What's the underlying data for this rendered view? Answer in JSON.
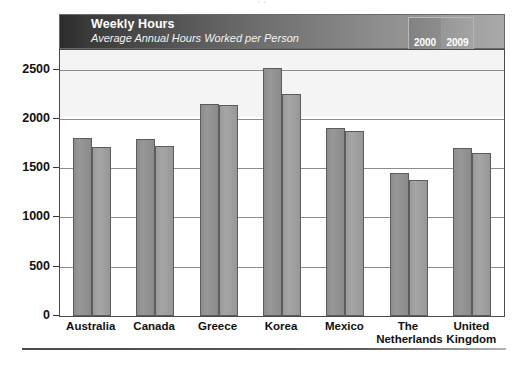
{
  "figure": {
    "clipped_top_text": "· ·",
    "bottom_rule": "divider"
  },
  "banner": {
    "title": "Weekly Hours",
    "subtitle": "Average Annual Hours Worked per Person"
  },
  "colors": {
    "series_2000": "#8f8f8f",
    "series_2009": "#9f9f9f",
    "banner_dark": "#2b2b2b",
    "banner_light": "#a9a9a9",
    "frame": "#4a4a4a",
    "gridline": "#8c8c8c",
    "band": "#f4f4f5"
  },
  "chart_data": {
    "type": "bar",
    "title": "Weekly Hours",
    "subtitle": "Average Annual Hours Worked per Person",
    "xlabel": "",
    "ylabel": "",
    "ylim": [
      0,
      2700
    ],
    "yticks": [
      0,
      500,
      1000,
      1500,
      2000,
      2500
    ],
    "ytick_labels": [
      "0",
      "500",
      "1000",
      "1500",
      "2000",
      "2500"
    ],
    "grid": true,
    "legend_position": "top-right",
    "categories": [
      "Australia",
      "Canada",
      "Greece",
      "Korea",
      "Mexico",
      "The Netherlands",
      "United Kingdom"
    ],
    "series": [
      {
        "name": "2000",
        "values": [
          1810,
          1800,
          2150,
          2520,
          1910,
          1450,
          1705
        ]
      },
      {
        "name": "2009",
        "values": [
          1720,
          1730,
          2140,
          2250,
          1880,
          1385,
          1650
        ]
      }
    ]
  }
}
